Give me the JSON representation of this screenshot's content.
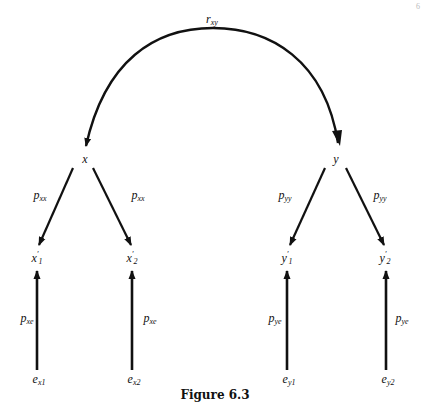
{
  "figure": {
    "caption": "Figure 6.3",
    "corner_mark": "6"
  },
  "nodes": {
    "x": {
      "label": "x"
    },
    "y": {
      "label": "y"
    },
    "x1": {
      "base": "x",
      "prime": "′",
      "sub": "1"
    },
    "x2": {
      "base": "x",
      "prime": "′",
      "sub": "2"
    },
    "y1": {
      "base": "y",
      "prime": "′",
      "sub": "1"
    },
    "y2": {
      "base": "y",
      "prime": "′",
      "sub": "2"
    },
    "ex1": {
      "base": "e",
      "sub": "x1"
    },
    "ex2": {
      "base": "e",
      "sub": "x2"
    },
    "ey1": {
      "base": "e",
      "sub": "y1"
    },
    "ey2": {
      "base": "e",
      "sub": "y2"
    }
  },
  "paths": {
    "rxy": {
      "base": "r",
      "sub": "xy"
    },
    "p_x_x1": {
      "base": "p",
      "sub": "xx"
    },
    "p_x_x2": {
      "base": "p",
      "sub": "xx"
    },
    "p_y_y1": {
      "base": "p",
      "sub": "yy"
    },
    "p_y_y2": {
      "base": "p",
      "sub": "yy"
    },
    "p_e_x1": {
      "base": "p",
      "sub": "xe"
    },
    "p_e_x2": {
      "base": "p",
      "sub": "xe"
    },
    "p_e_y1": {
      "base": "p",
      "sub": "ye"
    },
    "p_e_y2": {
      "base": "p",
      "sub": "ye"
    }
  },
  "colors": {
    "ink": "#111111",
    "background": "#ffffff"
  }
}
